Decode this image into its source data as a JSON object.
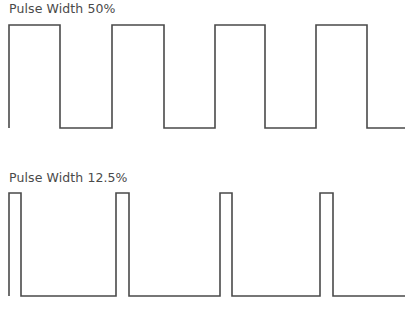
{
  "diagrams": [
    {
      "title": "Pulse Width 50%",
      "duty_cycle_percent": 50,
      "high_y": 25,
      "low_y": 128,
      "start_x": 9,
      "end_x": 405,
      "pulses": [
        [
          9,
          60
        ],
        [
          112,
          164
        ],
        [
          215,
          265
        ],
        [
          316,
          367
        ]
      ]
    },
    {
      "title": "Pulse Width 12.5%",
      "duty_cycle_percent": 12.5,
      "high_y": 193,
      "low_y": 296,
      "start_x": 9,
      "end_x": 405,
      "pulses": [
        [
          9,
          21
        ],
        [
          116,
          129
        ],
        [
          220,
          232
        ],
        [
          320,
          333
        ]
      ]
    }
  ],
  "colors": {
    "line": "#4a4a4a",
    "text": "#4a4a4a",
    "background": "#ffffff"
  }
}
